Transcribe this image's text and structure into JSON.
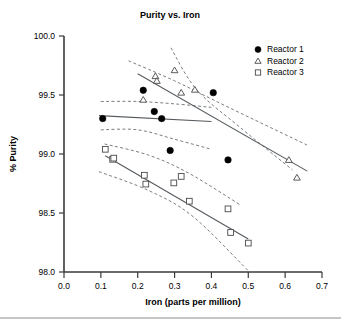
{
  "chart_data": {
    "type": "scatter",
    "title": "Purity vs. Iron",
    "xlabel": "Iron (parts per million)",
    "ylabel": "% Purity",
    "xlim": [
      0.0,
      0.7
    ],
    "ylim": [
      98.0,
      100.0
    ],
    "xticks": [
      "0.0",
      "0.1",
      "0.2",
      "0.3",
      "0.4",
      "0.5",
      "0.6",
      "0.7"
    ],
    "xtick_values": [
      0.0,
      0.1,
      0.2,
      0.3,
      0.4,
      0.5,
      0.6,
      0.7
    ],
    "yticks": [
      "98.0",
      "98.5",
      "99.0",
      "99.5",
      "100.0"
    ],
    "ytick_values": [
      98.0,
      98.5,
      99.0,
      99.5,
      100.0
    ],
    "grid": false,
    "legend_position": "top-right",
    "series": [
      {
        "name": "Reactor 1",
        "marker": "filled-circle",
        "color": "#000000",
        "points": [
          [
            0.105,
            99.3
          ],
          [
            0.215,
            99.54
          ],
          [
            0.245,
            99.36
          ],
          [
            0.265,
            99.3
          ],
          [
            0.288,
            99.03
          ],
          [
            0.405,
            99.52
          ],
          [
            0.445,
            98.95
          ]
        ],
        "fit_line": [
          [
            0.095,
            99.325
          ],
          [
            0.4,
            99.275
          ]
        ],
        "ci_upper": [
          [
            0.1,
            99.445
          ],
          [
            0.2,
            99.445
          ],
          [
            0.3,
            99.425
          ],
          [
            0.4,
            99.395
          ]
        ],
        "ci_lower": [
          [
            0.1,
            99.205
          ],
          [
            0.2,
            99.205
          ],
          [
            0.3,
            99.125
          ],
          [
            0.4,
            99.04
          ]
        ]
      },
      {
        "name": "Reactor 2",
        "marker": "open-triangle",
        "color": "#4a4a4a",
        "points": [
          [
            0.215,
            99.46
          ],
          [
            0.248,
            99.66
          ],
          [
            0.252,
            99.62
          ],
          [
            0.3,
            99.71
          ],
          [
            0.318,
            99.52
          ],
          [
            0.355,
            99.545
          ],
          [
            0.61,
            98.95
          ],
          [
            0.632,
            98.8
          ]
        ],
        "fit_line": [
          [
            0.2,
            99.68
          ],
          [
            0.66,
            98.855
          ]
        ],
        "ci_upper": [
          [
            0.175,
            99.79
          ],
          [
            0.3,
            99.62
          ],
          [
            0.45,
            99.39
          ],
          [
            0.66,
            99.075
          ]
        ],
        "ci_lower": [
          [
            0.29,
            99.9
          ],
          [
            0.36,
            99.545
          ],
          [
            0.48,
            99.22
          ],
          [
            0.62,
            98.865
          ]
        ]
      },
      {
        "name": "Reactor 3",
        "marker": "open-square",
        "color": "#4a4a4a",
        "points": [
          [
            0.112,
            99.04
          ],
          [
            0.132,
            98.955
          ],
          [
            0.135,
            98.965
          ],
          [
            0.218,
            98.82
          ],
          [
            0.222,
            98.745
          ],
          [
            0.298,
            98.755
          ],
          [
            0.318,
            98.81
          ],
          [
            0.34,
            98.6
          ],
          [
            0.445,
            98.535
          ],
          [
            0.452,
            98.335
          ],
          [
            0.5,
            98.245
          ]
        ],
        "fit_line": [
          [
            0.112,
            98.985
          ],
          [
            0.5,
            98.28
          ]
        ],
        "ci_upper": [
          [
            0.11,
            99.085
          ],
          [
            0.23,
            98.99
          ],
          [
            0.34,
            98.835
          ],
          [
            0.48,
            98.565
          ]
        ],
        "ci_lower": [
          [
            0.095,
            98.85
          ],
          [
            0.23,
            98.69
          ],
          [
            0.35,
            98.47
          ],
          [
            0.5,
            98.01
          ]
        ]
      }
    ]
  },
  "legend": {
    "entries": [
      {
        "label": "Reactor 1",
        "marker": "filled-circle"
      },
      {
        "label": "Reactor 2",
        "marker": "open-triangle"
      },
      {
        "label": "Reactor 3",
        "marker": "open-square"
      }
    ]
  }
}
